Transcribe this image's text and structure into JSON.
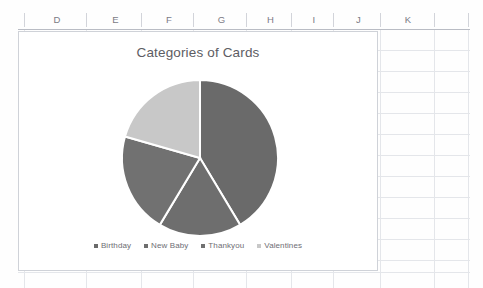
{
  "spreadsheet": {
    "column_headers": [
      {
        "label": "D",
        "left": 26,
        "width": 62
      },
      {
        "label": "E",
        "left": 88,
        "width": 55
      },
      {
        "label": "F",
        "left": 143,
        "width": 52
      },
      {
        "label": "G",
        "left": 195,
        "width": 53
      },
      {
        "label": "H",
        "left": 248,
        "width": 45
      },
      {
        "label": "I",
        "left": 293,
        "width": 42
      },
      {
        "label": "J",
        "left": 335,
        "width": 47
      },
      {
        "label": "K",
        "left": 382,
        "width": 52
      }
    ],
    "column_tick_positions": [
      24,
      86,
      141,
      193,
      246,
      291,
      333,
      380,
      434,
      468
    ],
    "row_line_positions": [
      50,
      71,
      92,
      113,
      134,
      155,
      176,
      197,
      218,
      239,
      260,
      272
    ],
    "grid_line_color": "#e4e6ea",
    "header_text_color": "#7b7b85"
  },
  "chart": {
    "title": "Categories of Cards",
    "border_color": "#cfd2d8",
    "background": "#ffffff",
    "legend_position": "bottom"
  },
  "chart_data": {
    "type": "pie",
    "title": "Categories of Cards",
    "xlabel": "",
    "ylabel": "",
    "categories": [
      "Birthday",
      "New Baby",
      "Thankyou",
      "Valentines"
    ],
    "values": [
      41.4,
      17.2,
      20.8,
      20.6
    ],
    "units": "percent",
    "slice_angles_deg": [
      149,
      62,
      75,
      74
    ],
    "start_angle_deg": 0,
    "direction": "clockwise",
    "colors": [
      "#6a6a6a",
      "#6e6e6e",
      "#717171",
      "#c8c8c8"
    ],
    "legend": [
      "Birthday",
      "New Baby",
      "Thankyou",
      "Valentines"
    ],
    "legend_position": "bottom",
    "grid": false,
    "data_labels": false,
    "center": {
      "x": 115,
      "y": 78
    },
    "radius": 78
  },
  "legend_items": [
    {
      "label": "Birthday",
      "color": "#6a6a6a"
    },
    {
      "label": "New Baby",
      "color": "#6e6e6e"
    },
    {
      "label": "Thankyou",
      "color": "#717171"
    },
    {
      "label": "Valentines",
      "color": "#c8c8c8"
    }
  ]
}
